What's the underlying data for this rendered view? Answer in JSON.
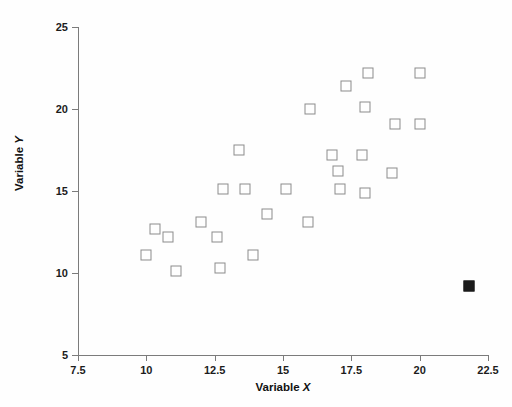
{
  "chart_data": {
    "type": "scatter",
    "title": "",
    "xlabel": "Variable X",
    "ylabel": "Variable Y",
    "xlim": [
      7.5,
      22.5
    ],
    "ylim": [
      5,
      25
    ],
    "xticks": [
      7.5,
      10,
      12.5,
      15,
      17.5,
      20,
      22.5
    ],
    "xticklabels": [
      "7.5",
      "10",
      "12.5",
      "15",
      "17.5",
      "20",
      "22.5"
    ],
    "yticks": [
      5,
      10,
      15,
      20,
      25
    ],
    "yticklabels": [
      "5",
      "10",
      "15",
      "20",
      "25"
    ],
    "grid": false,
    "legend": null,
    "series": [
      {
        "name": "observations",
        "marker": "open-square",
        "color": "#8b8b8b",
        "points": [
          [
            10.0,
            11.1
          ],
          [
            10.3,
            12.7
          ],
          [
            10.8,
            12.2
          ],
          [
            11.1,
            10.1
          ],
          [
            12.0,
            13.1
          ],
          [
            12.6,
            12.2
          ],
          [
            12.7,
            10.3
          ],
          [
            12.8,
            15.1
          ],
          [
            13.4,
            17.5
          ],
          [
            13.6,
            15.1
          ],
          [
            13.9,
            11.1
          ],
          [
            14.4,
            13.6
          ],
          [
            15.1,
            15.1
          ],
          [
            15.9,
            13.1
          ],
          [
            16.0,
            20.0
          ],
          [
            16.8,
            17.2
          ],
          [
            17.0,
            16.2
          ],
          [
            17.1,
            15.1
          ],
          [
            17.3,
            21.4
          ],
          [
            17.9,
            17.2
          ],
          [
            18.0,
            20.1
          ],
          [
            18.0,
            14.9
          ],
          [
            18.1,
            22.2
          ],
          [
            19.0,
            16.1
          ],
          [
            19.1,
            19.1
          ],
          [
            20.0,
            19.1
          ],
          [
            20.0,
            22.2
          ]
        ]
      },
      {
        "name": "outlier",
        "marker": "filled-square",
        "color": "#1b1b1b",
        "points": [
          [
            21.8,
            9.2
          ]
        ]
      }
    ]
  }
}
